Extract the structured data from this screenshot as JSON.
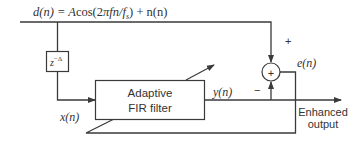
{
  "diagram": {
    "input_equation": {
      "lhs": "d(n) = ",
      "A": "A",
      "cos": "cos(2",
      "pi": "π",
      "fn": "fn/",
      "f": "f",
      "s": "s",
      "rest": ") + n(n)"
    },
    "delay_block": {
      "z": "z",
      "exponent": "−Δ"
    },
    "filter_block": {
      "line1": "Adaptive",
      "line2": "FIR filter"
    },
    "summing_junction": {
      "symbol": "+",
      "plus_label": "+",
      "minus_label": "−"
    },
    "signals": {
      "x": "x(n)",
      "y": "y(n)",
      "e": "e(n)"
    },
    "output": {
      "line1": "Enhanced",
      "line2": "output"
    },
    "colors": {
      "stroke": "#3a3a3a",
      "text": "#333333",
      "background": "#ffffff"
    }
  }
}
